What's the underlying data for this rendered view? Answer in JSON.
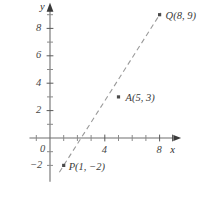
{
  "figure": {
    "axis_labels": {
      "x": "x",
      "y": "y"
    },
    "origin_label": "0"
  },
  "chart_data": {
    "type": "scatter",
    "title": "",
    "xlabel": "x",
    "ylabel": "y",
    "xlim": [
      -1.5,
      9.5
    ],
    "ylim": [
      -3.2,
      9.8
    ],
    "grid": false,
    "legend": null,
    "x_ticks_major": [
      4,
      8
    ],
    "x_tick_labels": [
      "4",
      "8"
    ],
    "x_ticks_minor": [
      -1,
      1,
      2,
      3,
      5,
      6,
      7,
      9
    ],
    "y_ticks_major": [
      2,
      4,
      6,
      8
    ],
    "y_tick_labels": [
      "2",
      "4",
      "6",
      "8"
    ],
    "y_ticks_minor": [
      -2,
      -1,
      1,
      3,
      5,
      7,
      9
    ],
    "origin_label": "0",
    "points": [
      {
        "name": "P",
        "label": "P(1, −2)",
        "x": 1,
        "y": -2,
        "label_dx": 5,
        "label_dy": 3
      },
      {
        "name": "A",
        "label": "A(5, 3)",
        "x": 5,
        "y": 3,
        "label_dx": 7,
        "label_dy": 2
      },
      {
        "name": "Q",
        "label": "Q(8, 9)",
        "x": 8,
        "y": 9,
        "label_dx": 6,
        "label_dy": 2
      }
    ],
    "line": {
      "style": "dashed",
      "color": "#9a9a9a",
      "from": {
        "x": 1,
        "y": -2
      },
      "to": {
        "x": 8,
        "y": 9
      }
    },
    "annotations": []
  }
}
